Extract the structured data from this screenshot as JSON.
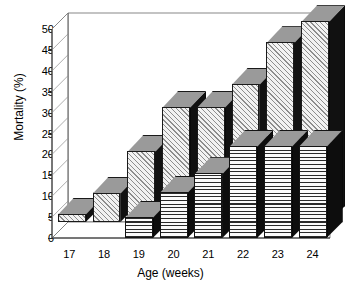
{
  "chart_data": {
    "type": "bar",
    "title": "",
    "subtitle": "",
    "xlabel": "Age (weeks)",
    "ylabel": "Mortality (%)",
    "categories": [
      "17",
      "18",
      "19",
      "20",
      "21",
      "22",
      "23",
      "24"
    ],
    "ylim": [
      0,
      50
    ],
    "yticks": [
      0,
      5,
      10,
      15,
      20,
      25,
      30,
      35,
      40,
      45,
      50
    ],
    "ytick_labels": [
      "0",
      "5",
      "10",
      "15",
      "20",
      "25",
      "30",
      "35",
      "40",
      "45",
      "50"
    ],
    "grid": true,
    "legend": "none",
    "projection": "3d-bar",
    "series": [
      {
        "name": "back-series",
        "fill": "diagonal-hatch",
        "values": [
          2,
          7,
          17,
          27.5,
          27.5,
          33,
          43,
          48
        ]
      },
      {
        "name": "front-series",
        "fill": "horizontal-stripes",
        "values": [
          0,
          0,
          5,
          11,
          15.5,
          22,
          22,
          22
        ]
      }
    ],
    "colors": {
      "hatch_line": "#8d8d8d",
      "hatch_fill": "#f2f2f2",
      "stripe_line": "#2b2b2b",
      "stripe_fill": "#fbfbfb",
      "bar_top": "#9a9a9a",
      "bar_side": "#111111",
      "axis": "#2a2a2a",
      "background": "#ffffff"
    }
  }
}
